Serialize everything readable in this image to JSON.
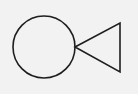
{
  "diagram": {
    "background": "#f2f2f2",
    "stroke": "#1e1e1e",
    "stroke_width": 1.6,
    "shapes": [
      {
        "type": "circle",
        "name": "circle",
        "cx": 44,
        "cy": 47,
        "r": 31
      },
      {
        "type": "triangle",
        "name": "triangle",
        "points": "75,47 120,23 120,72"
      }
    ]
  }
}
